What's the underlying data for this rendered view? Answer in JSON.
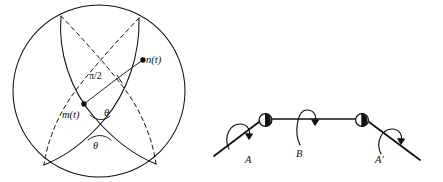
{
  "figure": {
    "background_color": "#ffffff",
    "ink_color": "#101010",
    "width": 443,
    "height": 182
  },
  "sphere_diagram": {
    "name": "sphere-geodesic-diagram",
    "outline_shape": "circle",
    "center": {
      "x": 99,
      "y": 91
    },
    "radius": 86,
    "curves": [
      {
        "id": "great-circle-1",
        "style": "solid-front-dashed-back"
      },
      {
        "id": "great-circle-2",
        "style": "solid-front-dashed-back"
      }
    ],
    "points": [
      {
        "id": "point-m",
        "label": "m(t)",
        "x": 84,
        "y": 104
      },
      {
        "id": "point-n",
        "label": "n(t)",
        "x": 143,
        "y": 60
      }
    ],
    "labels": {
      "m_of_t": "m(t)",
      "n_of_t": "n(t)",
      "quarter_turn": "π/2",
      "theta_upper": "θ",
      "theta_lower": "θ"
    }
  },
  "linkage_diagram": {
    "name": "shaft-linkage-diagram",
    "labels": {
      "joint_left": "A",
      "shaft_middle": "B",
      "joint_right": "A′"
    },
    "joints": [
      {
        "id": "joint-A",
        "label": "A",
        "x": 266,
        "y": 120,
        "type": "universal-joint"
      },
      {
        "id": "joint-A-prime",
        "label": "A′",
        "x": 362,
        "y": 120,
        "type": "universal-joint"
      }
    ],
    "shafts": [
      {
        "id": "shaft-input",
        "from_label": "A",
        "orientation": "descending-left"
      },
      {
        "id": "shaft-middle",
        "label": "B",
        "orientation": "horizontal"
      },
      {
        "id": "shaft-output",
        "from_label": "A′",
        "orientation": "descending-right"
      }
    ],
    "rotation_arrows": [
      {
        "id": "rotation-arrow-A",
        "about_label": "A",
        "direction": "clockwise"
      },
      {
        "id": "rotation-arrow-B",
        "about_label": "B",
        "direction": "clockwise"
      },
      {
        "id": "rotation-arrow-A-prime",
        "about_label": "A′",
        "direction": "clockwise"
      }
    ]
  }
}
